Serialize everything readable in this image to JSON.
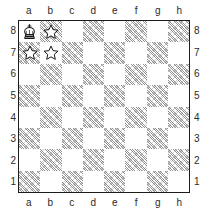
{
  "board": {
    "title": "chess-diagram",
    "files": [
      "a",
      "b",
      "c",
      "d",
      "e",
      "f",
      "g",
      "h"
    ],
    "ranks": [
      "8",
      "7",
      "6",
      "5",
      "4",
      "3",
      "2",
      "1"
    ],
    "files_top": [
      "a",
      "b",
      "c",
      "d",
      "e",
      "f",
      "g",
      "h"
    ],
    "files_bottom": [
      "a",
      "b",
      "c",
      "d",
      "e",
      "f",
      "g",
      "h"
    ],
    "ranks_left": [
      "8",
      "7",
      "6",
      "5",
      "4",
      "3",
      "2",
      "1"
    ],
    "ranks_right": [
      "8",
      "7",
      "6",
      "5",
      "4",
      "3",
      "2",
      "1"
    ],
    "orientation": "white-bottom",
    "light_square_color": "#ffffff",
    "dark_square_color": "#8c8c8c",
    "border_color": "#1c1c1c",
    "label_color": "#2b2b2b",
    "pieces": [
      {
        "square": "a8",
        "piece": "black-king",
        "icon": "king-icon"
      }
    ],
    "markers": [
      {
        "square": "b8",
        "marker": "star",
        "icon": "star-icon"
      },
      {
        "square": "a7",
        "marker": "star",
        "icon": "star-icon"
      },
      {
        "square": "b7",
        "marker": "star",
        "icon": "star-icon"
      }
    ],
    "squares": [
      {
        "id": "a8",
        "shade": "light"
      },
      {
        "id": "b8",
        "shade": "dark"
      },
      {
        "id": "c8",
        "shade": "light"
      },
      {
        "id": "d8",
        "shade": "dark"
      },
      {
        "id": "e8",
        "shade": "light"
      },
      {
        "id": "f8",
        "shade": "dark"
      },
      {
        "id": "g8",
        "shade": "light"
      },
      {
        "id": "h8",
        "shade": "dark"
      },
      {
        "id": "a7",
        "shade": "dark"
      },
      {
        "id": "b7",
        "shade": "light"
      },
      {
        "id": "c7",
        "shade": "dark"
      },
      {
        "id": "d7",
        "shade": "light"
      },
      {
        "id": "e7",
        "shade": "dark"
      },
      {
        "id": "f7",
        "shade": "light"
      },
      {
        "id": "g7",
        "shade": "dark"
      },
      {
        "id": "h7",
        "shade": "light"
      },
      {
        "id": "a6",
        "shade": "light"
      },
      {
        "id": "b6",
        "shade": "dark"
      },
      {
        "id": "c6",
        "shade": "light"
      },
      {
        "id": "d6",
        "shade": "dark"
      },
      {
        "id": "e6",
        "shade": "light"
      },
      {
        "id": "f6",
        "shade": "dark"
      },
      {
        "id": "g6",
        "shade": "light"
      },
      {
        "id": "h6",
        "shade": "dark"
      },
      {
        "id": "a5",
        "shade": "dark"
      },
      {
        "id": "b5",
        "shade": "light"
      },
      {
        "id": "c5",
        "shade": "dark"
      },
      {
        "id": "d5",
        "shade": "light"
      },
      {
        "id": "e5",
        "shade": "dark"
      },
      {
        "id": "f5",
        "shade": "light"
      },
      {
        "id": "g5",
        "shade": "dark"
      },
      {
        "id": "h5",
        "shade": "light"
      },
      {
        "id": "a4",
        "shade": "light"
      },
      {
        "id": "b4",
        "shade": "dark"
      },
      {
        "id": "c4",
        "shade": "light"
      },
      {
        "id": "d4",
        "shade": "dark"
      },
      {
        "id": "e4",
        "shade": "light"
      },
      {
        "id": "f4",
        "shade": "dark"
      },
      {
        "id": "g4",
        "shade": "light"
      },
      {
        "id": "h4",
        "shade": "dark"
      },
      {
        "id": "a3",
        "shade": "dark"
      },
      {
        "id": "b3",
        "shade": "light"
      },
      {
        "id": "c3",
        "shade": "dark"
      },
      {
        "id": "d3",
        "shade": "light"
      },
      {
        "id": "e3",
        "shade": "dark"
      },
      {
        "id": "f3",
        "shade": "light"
      },
      {
        "id": "g3",
        "shade": "dark"
      },
      {
        "id": "h3",
        "shade": "light"
      },
      {
        "id": "a2",
        "shade": "light"
      },
      {
        "id": "b2",
        "shade": "dark"
      },
      {
        "id": "c2",
        "shade": "light"
      },
      {
        "id": "d2",
        "shade": "dark"
      },
      {
        "id": "e2",
        "shade": "light"
      },
      {
        "id": "f2",
        "shade": "dark"
      },
      {
        "id": "g2",
        "shade": "light"
      },
      {
        "id": "h2",
        "shade": "dark"
      },
      {
        "id": "a1",
        "shade": "dark"
      },
      {
        "id": "b1",
        "shade": "light"
      },
      {
        "id": "c1",
        "shade": "dark"
      },
      {
        "id": "d1",
        "shade": "light"
      },
      {
        "id": "e1",
        "shade": "dark"
      },
      {
        "id": "f1",
        "shade": "light"
      },
      {
        "id": "g1",
        "shade": "dark"
      },
      {
        "id": "h1",
        "shade": "light"
      }
    ]
  }
}
